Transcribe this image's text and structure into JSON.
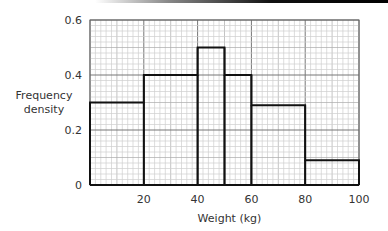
{
  "chart_data": {
    "type": "histogram",
    "title": "",
    "xlabel": "Weight (kg)",
    "ylabel": [
      "Frequency",
      "density"
    ],
    "xlim": [
      0,
      100
    ],
    "ylim": [
      0,
      0.6
    ],
    "xticks": [
      "20",
      "40",
      "60",
      "80",
      "100"
    ],
    "yticks": [
      "0",
      "0.2",
      "0.4",
      "0.6"
    ],
    "grid": true,
    "bins": [
      {
        "x0": 0,
        "x1": 20,
        "density": 0.3
      },
      {
        "x0": 20,
        "x1": 40,
        "density": 0.4
      },
      {
        "x0": 40,
        "x1": 50,
        "density": 0.5
      },
      {
        "x0": 50,
        "x1": 60,
        "density": 0.4
      },
      {
        "x0": 60,
        "x1": 80,
        "density": 0.29
      },
      {
        "x0": 80,
        "x1": 100,
        "density": 0.09
      }
    ]
  },
  "layout": {
    "left": 90,
    "right": 359,
    "top": 20,
    "bottom": 185
  }
}
